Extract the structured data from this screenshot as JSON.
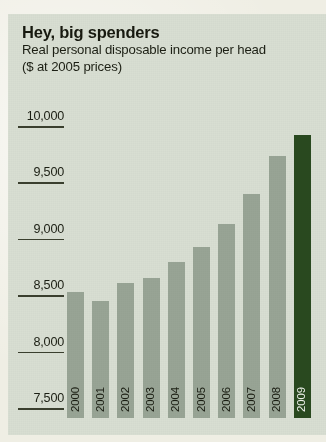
{
  "panel": {
    "background": "#d8ded2",
    "page_background": "#efeee4"
  },
  "header": {
    "title": "Hey, big spenders",
    "subtitle_line1": "Real personal disposable income per head",
    "subtitle_line2": "($ at 2005 prices)"
  },
  "colors": {
    "bar": "#9aa697",
    "bar_highlight": "#2a4a20",
    "text": "#1b1e13",
    "rule": "#3a3f2e"
  },
  "chart_data": {
    "type": "bar",
    "title": "Hey, big spenders",
    "subtitle": "Real personal disposable income per head ($ at 2005 prices)",
    "xlabel": "",
    "ylabel": "",
    "categories": [
      "2000",
      "2001",
      "2002",
      "2003",
      "2004",
      "2005",
      "2006",
      "2007",
      "2008",
      "2009"
    ],
    "values": [
      8530,
      8450,
      8610,
      8650,
      8790,
      8930,
      9130,
      9400,
      9730,
      9920
    ],
    "highlight_category": "2009",
    "ylim": [
      7500,
      10000
    ],
    "yticks": [
      10000,
      9500,
      9000,
      8500,
      8000,
      7500
    ],
    "ytick_labels": [
      "10,000",
      "9,500",
      "9,000",
      "8,500",
      "8,000",
      "7,500"
    ],
    "grid": false,
    "legend": false
  }
}
